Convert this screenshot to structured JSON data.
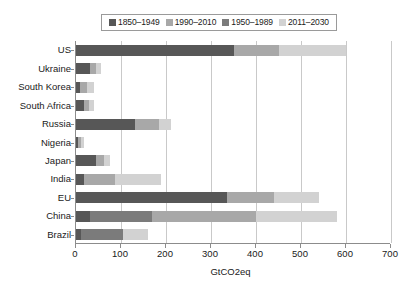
{
  "chart_data": {
    "type": "bar",
    "orientation": "horizontal",
    "stacked": true,
    "title": "",
    "xlabel": "GtCO2eq",
    "ylabel": "",
    "xlim": [
      0,
      700
    ],
    "xticks": [
      0,
      100,
      200,
      300,
      400,
      500,
      600,
      700
    ],
    "xticklabels": [
      "0",
      "100",
      "200",
      "300",
      "400",
      "500",
      "600",
      "700"
    ],
    "grid": "vertical",
    "legend_position": "top-center",
    "categories": [
      "US",
      "Ukraine",
      "South Korea",
      "South Africa",
      "Russia",
      "Nigeria",
      "Japan",
      "India",
      "EU",
      "China",
      "Brazil"
    ],
    "series": [
      {
        "name": "1850–1949",
        "color": "#575757",
        "values": [
          350,
          30,
          8,
          18,
          130,
          5,
          45,
          18,
          335,
          32,
          12
        ]
      },
      {
        "name": "1950–1989",
        "color": "#7b7b7b",
        "values": [
          0,
          0,
          0,
          0,
          0,
          0,
          0,
          0,
          0,
          138,
          93
        ]
      },
      {
        "name": "1990–2010",
        "color": "#a8a8a8",
        "values": [
          100,
          14,
          17,
          12,
          55,
          6,
          18,
          68,
          105,
          230,
          0
        ]
      },
      {
        "name": "2011–2030",
        "color": "#d2d2d2",
        "values": [
          150,
          11,
          15,
          10,
          25,
          7,
          12,
          104,
          100,
          180,
          55
        ]
      }
    ],
    "totals": [
      600,
      55,
      40,
      40,
      210,
      18,
      75,
      190,
      540,
      580,
      160
    ]
  },
  "legend": {
    "items": [
      {
        "label": "1850–1949",
        "color": "#575757"
      },
      {
        "label": "1990–2010",
        "color": "#a8a8a8"
      },
      {
        "label": "1950–1989",
        "color": "#7b7b7b"
      },
      {
        "label": "2011–2030",
        "color": "#d2d2d2"
      }
    ]
  },
  "axis": {
    "x_title": "GtCO2eq"
  },
  "colors": {
    "axis": "#8c8c8c",
    "grid": "#c9c9c9",
    "text": "#1a1a1a",
    "background": "#ffffff"
  }
}
